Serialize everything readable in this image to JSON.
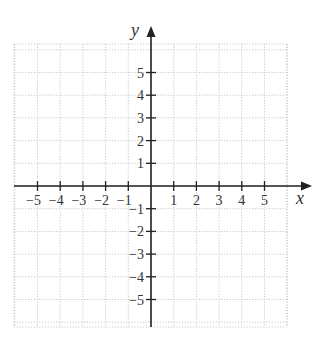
{
  "figure": {
    "type": "coordinate-plane",
    "axes": {
      "x": {
        "label": "x",
        "min": -5,
        "max": 5
      },
      "y": {
        "label": "y",
        "min": -5,
        "max": 5
      }
    },
    "x_ticks": [
      {
        "value": -5,
        "label": "−5"
      },
      {
        "value": -4,
        "label": "−4"
      },
      {
        "value": -3,
        "label": "−3"
      },
      {
        "value": -2,
        "label": "−2"
      },
      {
        "value": -1,
        "label": "−1"
      },
      {
        "value": 1,
        "label": "1"
      },
      {
        "value": 2,
        "label": "2"
      },
      {
        "value": 3,
        "label": "3"
      },
      {
        "value": 4,
        "label": "4"
      },
      {
        "value": 5,
        "label": "5"
      }
    ],
    "y_ticks": [
      {
        "value": 5,
        "label": "5"
      },
      {
        "value": 4,
        "label": "4"
      },
      {
        "value": 3,
        "label": "3"
      },
      {
        "value": 2,
        "label": "2"
      },
      {
        "value": 1,
        "label": "1"
      },
      {
        "value": -1,
        "label": "−1"
      },
      {
        "value": -2,
        "label": "−2"
      },
      {
        "value": -3,
        "label": "−3"
      },
      {
        "value": -4,
        "label": "−4"
      },
      {
        "value": -5,
        "label": "−5"
      }
    ],
    "grid": {
      "visible": true,
      "style": "dotted",
      "color": "#c9c9c9"
    },
    "axis_color": "#222222"
  }
}
